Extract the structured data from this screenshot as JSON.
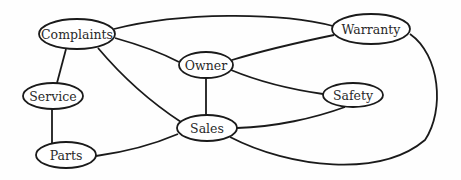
{
  "diagram": {
    "type": "undirected-graph",
    "colors": {
      "stroke": "#1a1a1a",
      "fill": "#ffffff",
      "text": "#2a2a2a",
      "background": "#fefefe"
    },
    "nodes": [
      {
        "id": "complaints",
        "label": "Complaints",
        "cx": 77,
        "cy": 34,
        "rx": 38,
        "ry": 15
      },
      {
        "id": "owner",
        "label": "Owner",
        "cx": 206,
        "cy": 65,
        "rx": 27,
        "ry": 13
      },
      {
        "id": "warranty",
        "label": "Warranty",
        "cx": 371,
        "cy": 29,
        "rx": 39,
        "ry": 15
      },
      {
        "id": "safety",
        "label": "Safety",
        "cx": 353,
        "cy": 95,
        "rx": 30,
        "ry": 12
      },
      {
        "id": "service",
        "label": "Service",
        "cx": 53,
        "cy": 96,
        "rx": 30,
        "ry": 13
      },
      {
        "id": "parts",
        "label": "Parts",
        "cx": 66,
        "cy": 155,
        "rx": 30,
        "ry": 13
      },
      {
        "id": "sales",
        "label": "Sales",
        "cx": 207,
        "cy": 128,
        "rx": 30,
        "ry": 13
      }
    ],
    "edges": [
      {
        "from": "complaints",
        "to": "warranty",
        "path": "M114,29 C180,12 280,12 333,26"
      },
      {
        "from": "complaints",
        "to": "owner",
        "path": "M115,38 C140,45 160,52 179,62"
      },
      {
        "from": "complaints",
        "to": "service",
        "path": "M66,49 L57,83"
      },
      {
        "from": "complaints",
        "to": "sales",
        "path": "M98,48 C125,80 155,105 181,122"
      },
      {
        "from": "owner",
        "to": "warranty",
        "path": "M232,60 C265,50 300,42 334,35"
      },
      {
        "from": "owner",
        "to": "safety",
        "path": "M231,70 C260,82 295,90 323,94"
      },
      {
        "from": "owner",
        "to": "sales",
        "path": "M206,78 L206,115"
      },
      {
        "from": "service",
        "to": "parts",
        "path": "M52,109 L52,143"
      },
      {
        "from": "sales",
        "to": "parts",
        "path": "M178,134 C150,146 125,152 96,156"
      },
      {
        "from": "sales",
        "to": "safety",
        "path": "M237,128 C275,127 315,118 345,107"
      },
      {
        "from": "sales",
        "to": "warranty",
        "path": "M230,137 C290,168 380,178 425,140 C445,110 440,55 410,34"
      }
    ]
  }
}
